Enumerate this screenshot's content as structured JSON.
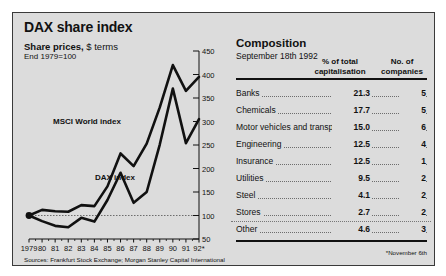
{
  "panel": {
    "title": "DAX share index",
    "chart_subtitle_bold": "Share prices,",
    "chart_subtitle_light": " $ terms",
    "chart_subtitle2": "End 1979=100",
    "sources": "Sources: Frankfurt Stock Exchange; Morgan Stanley Capital International",
    "footnote": "*November 6th"
  },
  "table": {
    "title": "Composition",
    "date": "September 18th 1992",
    "header_pct": "% of total capitalisation",
    "header_pct_line1": "% of total",
    "header_pct_line2": "capitalisation",
    "header_no_line1": "No. of",
    "header_no_line2": "companies",
    "rows": [
      {
        "name": "Banks",
        "pct": "21.3",
        "companies": "5"
      },
      {
        "name": "Chemicals",
        "pct": "17.7",
        "companies": "5"
      },
      {
        "name": "Motor vehicles and transport",
        "pct": "15.0",
        "companies": "6"
      },
      {
        "name": "Engineering",
        "pct": "12.5",
        "companies": "4"
      },
      {
        "name": "Insurance",
        "pct": "12.5",
        "companies": "1"
      },
      {
        "name": "Utilities",
        "pct": "9.5",
        "companies": "2"
      },
      {
        "name": "Steel",
        "pct": "4.1",
        "companies": "2"
      },
      {
        "name": "Stores",
        "pct": "2.7",
        "companies": "2"
      },
      {
        "name": "Other",
        "pct": "4.6",
        "companies": "3"
      }
    ]
  },
  "chart_data": {
    "type": "line",
    "title": "DAX share index",
    "subtitle": "Share prices, $ terms",
    "ylabel": "End 1979=100",
    "xlabel": "",
    "ylim": [
      50,
      450
    ],
    "yticks": [
      50,
      100,
      150,
      200,
      250,
      300,
      350,
      400,
      450
    ],
    "ytick_labels": [
      "50",
      "100",
      "150",
      "200",
      "250",
      "300",
      "350",
      "400",
      "450"
    ],
    "y_axis_position": "right",
    "gridline_at": 100,
    "grid": false,
    "legend": "inline-labels",
    "x": [
      1979,
      1980,
      1981,
      1982,
      1983,
      1984,
      1985,
      1986,
      1987,
      1988,
      1989,
      1990,
      1991,
      1992
    ],
    "xtick_labels": [
      "1979",
      "80",
      "81",
      "82",
      "83",
      "84",
      "85",
      "86",
      "87",
      "88",
      "89",
      "90",
      "91",
      "92*"
    ],
    "series": [
      {
        "name": "MSCI World index",
        "values": [
          100,
          112,
          109,
          108,
          122,
          120,
          162,
          232,
          205,
          253,
          330,
          420,
          365,
          395
        ]
      },
      {
        "name": "DAX index",
        "values": [
          100,
          88,
          78,
          75,
          95,
          87,
          133,
          191,
          127,
          150,
          251,
          370,
          254,
          305
        ]
      }
    ]
  }
}
